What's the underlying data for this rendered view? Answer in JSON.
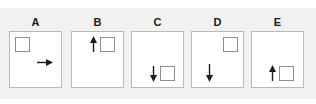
{
  "figure": {
    "width": 316,
    "height": 104,
    "background_color": "#ffffff",
    "band_color": "#f1f1f1",
    "panel_border_color": "#b9b9b9",
    "panel_fill_color": "#ffffff",
    "square_border_color": "#8d8d8d",
    "arrow_color": "#1c1c1c",
    "label_color": "#1c1c1c"
  },
  "panels": [
    {
      "label": "A",
      "square_name": "square-shape",
      "arrow_name": "right-arrow-icon",
      "arrow_direction": "right",
      "square_position": "top-left",
      "arrow_position": "middle-right"
    },
    {
      "label": "B",
      "square_name": "square-shape",
      "arrow_name": "up-arrow-icon",
      "arrow_direction": "up",
      "square_position": "top-right-of-center",
      "arrow_position": "top-center"
    },
    {
      "label": "C",
      "square_name": "square-shape",
      "arrow_name": "down-arrow-icon",
      "arrow_direction": "down",
      "square_position": "bottom-right-of-center",
      "arrow_position": "bottom-center"
    },
    {
      "label": "D",
      "square_name": "square-shape",
      "arrow_name": "down-arrow-icon",
      "arrow_direction": "down",
      "square_position": "top-right",
      "arrow_position": "bottom-left-of-center"
    },
    {
      "label": "E",
      "square_name": "square-shape",
      "arrow_name": "up-arrow-icon",
      "arrow_direction": "up",
      "square_position": "bottom-right-of-center",
      "arrow_position": "bottom-center"
    }
  ]
}
